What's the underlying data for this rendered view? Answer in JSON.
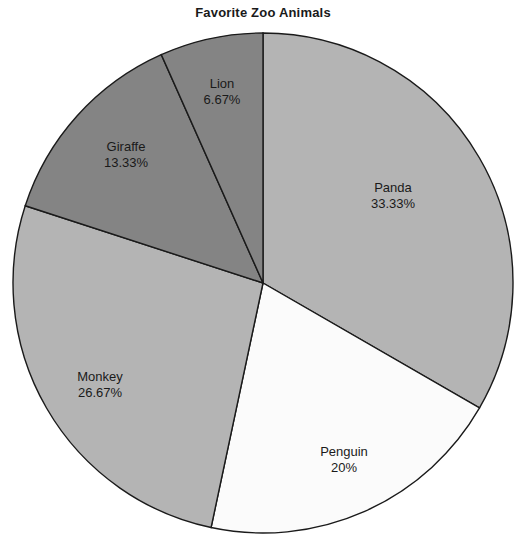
{
  "chart": {
    "title": "Favorite Zoo Animals"
  },
  "chart_data": {
    "type": "pie",
    "title": "Favorite Zoo Animals",
    "xlabel": "",
    "ylabel": "",
    "legend": "none",
    "grid": false,
    "start_angle_deg": 90,
    "direction": "clockwise",
    "categories": [
      "Panda",
      "Penguin",
      "Monkey",
      "Giraffe",
      "Lion"
    ],
    "values": [
      33.33,
      20,
      26.67,
      13.33,
      6.67
    ],
    "labels": [
      "33.33%",
      "20%",
      "26.67%",
      "13.33%",
      "6.67%"
    ],
    "colors": [
      "#b4b4b4",
      "#fbfbfb",
      "#b4b4b4",
      "#848484",
      "#848484"
    ],
    "edge_color": "#1a1a1a",
    "slices": [
      {
        "name": "Panda",
        "value": 33.33,
        "label": "33.33%",
        "color": "#b4b4b4",
        "label_x": 393,
        "label_y": 192
      },
      {
        "name": "Penguin",
        "value": 20,
        "label": "20%",
        "color": "#fbfbfb",
        "label_x": 344,
        "label_y": 456
      },
      {
        "name": "Monkey",
        "value": 26.67,
        "label": "26.67%",
        "color": "#b4b4b4",
        "label_x": 100,
        "label_y": 381
      },
      {
        "name": "Giraffe",
        "value": 13.33,
        "label": "13.33%",
        "color": "#848484",
        "label_x": 126,
        "label_y": 151
      },
      {
        "name": "Lion",
        "value": 6.67,
        "label": "6.67%",
        "color": "#848484",
        "label_x": 222,
        "label_y": 88
      }
    ],
    "geometry": {
      "cx": 263,
      "cy": 283,
      "r": 250
    }
  }
}
